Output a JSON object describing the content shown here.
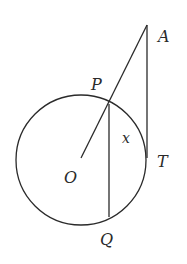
{
  "diagram": {
    "type": "geometry",
    "stroke_color": "#2a2a2a",
    "circle": {
      "center_label": "O",
      "cx": 81,
      "cy": 160,
      "r": 65
    },
    "points": {
      "A": {
        "label": "A",
        "x": 147,
        "y": 25
      },
      "P": {
        "label": "P",
        "x": 109,
        "y": 104
      },
      "O": {
        "label": "O",
        "x": 81,
        "y": 158
      },
      "T": {
        "label": "T",
        "x": 147,
        "y": 158
      },
      "Q": {
        "label": "Q",
        "x": 109,
        "y": 217
      }
    },
    "angle_label": "x",
    "segments": [
      "OA",
      "AT",
      "PQ"
    ]
  }
}
